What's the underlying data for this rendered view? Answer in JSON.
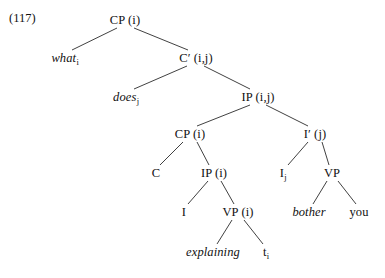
{
  "figure": {
    "example_number": "(117)",
    "type": "syntax-tree",
    "sentence": "what does explaining bother you",
    "width": 385,
    "height": 278,
    "line_color": "#2b2b2b",
    "text_color": "#111111",
    "background_color": "#ffffff"
  },
  "nodes": [
    {
      "id": "cp_root",
      "label": "CP",
      "index": "(i)",
      "sub": "",
      "style": "roman",
      "x": 125,
      "y": 20
    },
    {
      "id": "what",
      "label": "what",
      "index": "",
      "sub": "i",
      "style": "italic",
      "x": 65,
      "y": 58
    },
    {
      "id": "cbar",
      "label": "C′",
      "index": "(i,j)",
      "sub": "",
      "style": "roman",
      "x": 196,
      "y": 58
    },
    {
      "id": "does",
      "label": "does",
      "index": "",
      "sub": "j",
      "style": "italic",
      "x": 126,
      "y": 97
    },
    {
      "id": "ip_top",
      "label": "IP",
      "index": "(i,j)",
      "sub": "",
      "style": "roman",
      "x": 258,
      "y": 97
    },
    {
      "id": "cp_embedded",
      "label": "CP",
      "index": "(i)",
      "sub": "",
      "style": "roman",
      "x": 190,
      "y": 134
    },
    {
      "id": "ibar",
      "label": "I′",
      "index": "(j)",
      "sub": "",
      "style": "roman",
      "x": 315,
      "y": 134
    },
    {
      "id": "c_head",
      "label": "C",
      "index": "",
      "sub": "",
      "style": "roman",
      "x": 156,
      "y": 173
    },
    {
      "id": "ip_embedded",
      "label": "IP",
      "index": "(i)",
      "sub": "",
      "style": "roman",
      "x": 214,
      "y": 173
    },
    {
      "id": "i_head_j",
      "label": "I",
      "index": "",
      "sub": "j",
      "style": "roman",
      "x": 283,
      "y": 173
    },
    {
      "id": "vp_matrix",
      "label": "VP",
      "index": "",
      "sub": "",
      "style": "roman",
      "x": 332,
      "y": 173
    },
    {
      "id": "i_head",
      "label": "I",
      "index": "",
      "sub": "",
      "style": "roman",
      "x": 184,
      "y": 212
    },
    {
      "id": "vp_embedded",
      "label": "VP",
      "index": "(i)",
      "sub": "",
      "style": "roman",
      "x": 238,
      "y": 212
    },
    {
      "id": "bother",
      "label": "bother",
      "index": "",
      "sub": "",
      "style": "italic",
      "x": 309,
      "y": 212
    },
    {
      "id": "you",
      "label": "you",
      "index": "",
      "sub": "",
      "style": "roman",
      "x": 359,
      "y": 212
    },
    {
      "id": "explaining",
      "label": "explaining",
      "index": "",
      "sub": "",
      "style": "italic",
      "x": 213,
      "y": 252
    },
    {
      "id": "trace_i",
      "label": "t",
      "index": "",
      "sub": "i",
      "style": "roman",
      "x": 266,
      "y": 252
    }
  ],
  "edges": [
    {
      "from": "cp_root",
      "to": "what",
      "x1": 117,
      "y1": 28,
      "x2": 72,
      "y2": 50
    },
    {
      "from": "cp_root",
      "to": "cbar",
      "x1": 134,
      "y1": 28,
      "x2": 188,
      "y2": 50
    },
    {
      "from": "cbar",
      "to": "does",
      "x1": 187,
      "y1": 66,
      "x2": 134,
      "y2": 89
    },
    {
      "from": "cbar",
      "to": "ip_top",
      "x1": 204,
      "y1": 66,
      "x2": 250,
      "y2": 89
    },
    {
      "from": "ip_top",
      "to": "cp_embedded",
      "x1": 250,
      "y1": 105,
      "x2": 197,
      "y2": 126
    },
    {
      "from": "ip_top",
      "to": "ibar",
      "x1": 266,
      "y1": 105,
      "x2": 308,
      "y2": 126
    },
    {
      "from": "cp_embedded",
      "to": "c_head",
      "x1": 183,
      "y1": 142,
      "x2": 160,
      "y2": 165
    },
    {
      "from": "cp_embedded",
      "to": "ip_embedded",
      "x1": 197,
      "y1": 142,
      "x2": 209,
      "y2": 165
    },
    {
      "from": "ibar",
      "to": "i_head_j",
      "x1": 308,
      "y1": 142,
      "x2": 288,
      "y2": 165
    },
    {
      "from": "ibar",
      "to": "vp_matrix",
      "x1": 322,
      "y1": 142,
      "x2": 329,
      "y2": 165
    },
    {
      "from": "ip_embedded",
      "to": "i_head",
      "x1": 208,
      "y1": 181,
      "x2": 188,
      "y2": 204
    },
    {
      "from": "ip_embedded",
      "to": "vp_embedded",
      "x1": 221,
      "y1": 181,
      "x2": 234,
      "y2": 204
    },
    {
      "from": "vp_matrix",
      "to": "bother",
      "x1": 327,
      "y1": 181,
      "x2": 313,
      "y2": 204
    },
    {
      "from": "vp_matrix",
      "to": "you",
      "x1": 338,
      "y1": 181,
      "x2": 356,
      "y2": 204
    },
    {
      "from": "vp_embedded",
      "to": "explaining",
      "x1": 232,
      "y1": 220,
      "x2": 217,
      "y2": 244
    },
    {
      "from": "vp_embedded",
      "to": "trace_i",
      "x1": 244,
      "y1": 220,
      "x2": 263,
      "y2": 244
    }
  ]
}
